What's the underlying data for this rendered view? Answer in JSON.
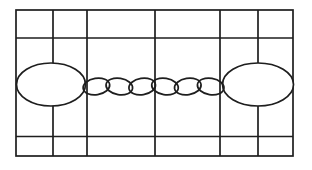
{
  "canvas": {
    "width": 312,
    "height": 170,
    "background": "#ffffff",
    "ink_color": "#1e1e1e",
    "stroke_width": 1.7
  },
  "frame": {
    "outer": {
      "x": 16,
      "y": 10,
      "w": 277,
      "h": 146
    },
    "h_lines_y": [
      38,
      136.5
    ],
    "v_lines_x": [
      53,
      87,
      155,
      220,
      258
    ]
  },
  "large_links": [
    {
      "name": "left-oval-link",
      "cx": 51,
      "cy": 84.5,
      "rx": 34.5,
      "ry": 21.5
    },
    {
      "name": "right-oval-link",
      "cx": 258,
      "cy": 84.5,
      "rx": 35.5,
      "ry": 21.5
    }
  ],
  "chain": {
    "cy": 86.5,
    "rx": 13.4,
    "ry": 8.2,
    "links": [
      {
        "cx": 96.4,
        "tilt": -9
      },
      {
        "cx": 119.3,
        "tilt": 9
      },
      {
        "cx": 142.2,
        "tilt": -9
      },
      {
        "cx": 165.0,
        "tilt": 9
      },
      {
        "cx": 187.8,
        "tilt": -9
      },
      {
        "cx": 210.7,
        "tilt": 9
      }
    ]
  }
}
